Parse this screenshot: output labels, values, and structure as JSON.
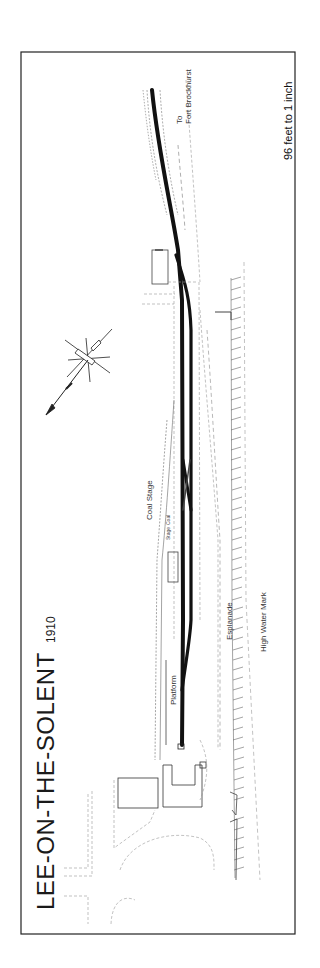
{
  "map": {
    "title": "LEE-ON-THE-SOLENT",
    "year": "1910",
    "scale": "96 feet to 1 inch",
    "labels": {
      "to": "To",
      "destination": "Fort Brockhurst",
      "coal_stage": "Coal Stage",
      "platform": "Platform",
      "esplanade": "Esplanade",
      "high_water_mark": "High Water Mark",
      "coal_small_1": "Coal",
      "coal_small_2": "Stage"
    },
    "colors": {
      "track": "#111111",
      "border": "#222222",
      "dashed": "#888888",
      "background": "#ffffff"
    }
  }
}
